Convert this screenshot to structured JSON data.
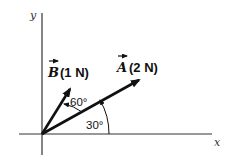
{
  "diagram": {
    "axes": {
      "x_label": "x",
      "y_label": "y"
    },
    "vectors": [
      {
        "symbol": "A",
        "magnitude": "(2 N)",
        "angle_deg": 30,
        "angle_label": "30°"
      },
      {
        "symbol": "B",
        "magnitude": "(1 N)",
        "angle_deg": 60,
        "angle_label": "60°",
        "angle_reference": "between A and B"
      }
    ],
    "colors": {
      "line": "#111111",
      "background": "#ffffff"
    }
  }
}
